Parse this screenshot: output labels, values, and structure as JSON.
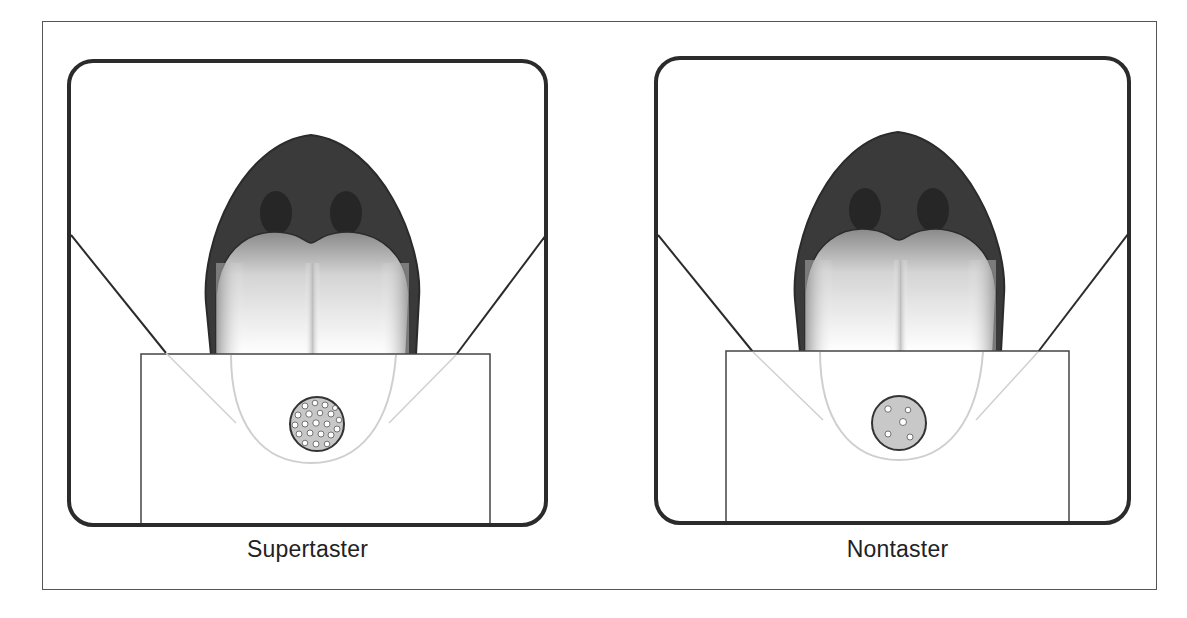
{
  "figure": {
    "panels": [
      {
        "id": "supertaster",
        "caption": "Supertaster",
        "papillae_density": "high",
        "papillae_count": 30
      },
      {
        "id": "nontaster",
        "caption": "Nontaster",
        "papillae_density": "low",
        "papillae_count": 5
      }
    ]
  },
  "colors": {
    "outline": "#2b2b2b",
    "mouth": "#3a3a3a",
    "tongue_edge": "#9a9a9a",
    "dot_fill": "#c8c8c8"
  }
}
